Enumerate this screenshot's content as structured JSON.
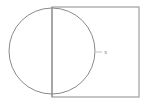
{
  "diagram": {
    "stroke_color": "#8a8a8a",
    "circle": {
      "cx": 52,
      "cy": 51,
      "r": 43
    },
    "diameter": {
      "x": 52,
      "y1": 7,
      "y2": 97
    },
    "rectangle": {
      "x": 52,
      "y": 7,
      "width": 87,
      "height": 90
    },
    "marker": {
      "x": 96,
      "y": 52,
      "label": "x"
    }
  }
}
